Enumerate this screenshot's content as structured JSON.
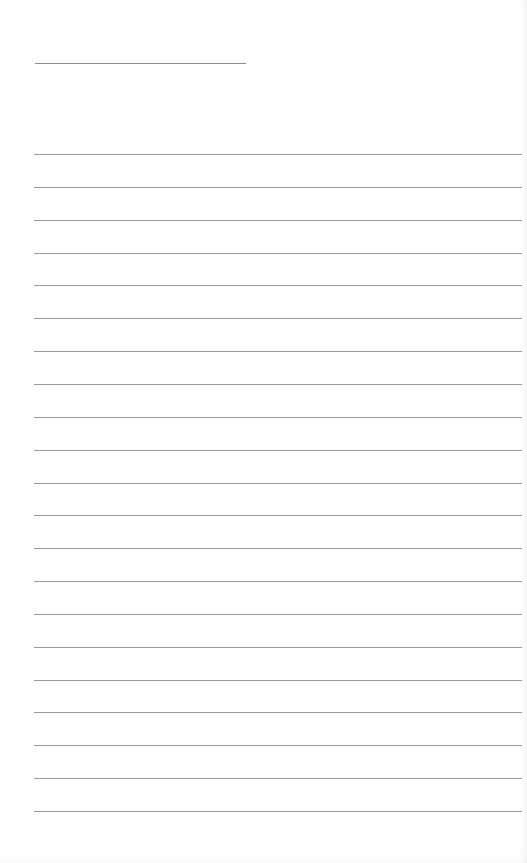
{
  "document": {
    "type": "lined-paper",
    "title_line": {
      "present": true
    },
    "rule_count": 21,
    "first_rule_y": 154,
    "rule_spacing": 32.85,
    "rule_color": "#9a9a9a",
    "paper_color": "#fefefe"
  }
}
